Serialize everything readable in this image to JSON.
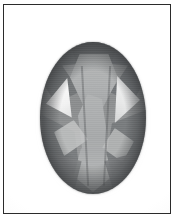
{
  "image": {
    "kind": "photograph",
    "subject": "oval-cut faceted gemstone",
    "rendering": "grayscale",
    "caption": "",
    "frame": {
      "present": true,
      "style": "thin rectangular border",
      "color": "#2b2b2b",
      "background_color": "#fdfdfd"
    },
    "background": {
      "color": "#ffffff",
      "description": "plain white studio backdrop with soft shadow"
    },
    "gemstone": {
      "cut": "oval brilliant",
      "outline": "oval",
      "body_color": "#8f9192",
      "highlight_color": "#ffffff",
      "shadow_color": "#74777a",
      "facets": [
        {
          "name": "table",
          "tone": "light",
          "color": "#b0b2b3"
        },
        {
          "name": "crown-upper-left-break",
          "tone": "dark",
          "color": "#75787a"
        },
        {
          "name": "crown-upper-right-break",
          "tone": "dark",
          "color": "#74777a"
        },
        {
          "name": "top-cap",
          "tone": "dark",
          "color": "#6f7274"
        },
        {
          "name": "star-left",
          "tone": "mid",
          "color": "#9c9e9f"
        },
        {
          "name": "star-right",
          "tone": "mid",
          "color": "#9a9c9d"
        },
        {
          "name": "left-triangular-highlight",
          "tone": "bright",
          "color": "#ffffff"
        },
        {
          "name": "right-triangular-highlight",
          "tone": "bright",
          "color": "#f0f1f1"
        },
        {
          "name": "pavilion-center-wedge",
          "tone": "light",
          "color": "#adafb0"
        },
        {
          "name": "pavilion-left-wedge",
          "tone": "dark",
          "color": "#7b7e80"
        },
        {
          "name": "pavilion-right-wedge",
          "tone": "dark",
          "color": "#7a7d7f"
        },
        {
          "name": "lower-left-flash",
          "tone": "light",
          "color": "#c3c5c5"
        },
        {
          "name": "lower-right-flash",
          "tone": "light",
          "color": "#bdbfbf"
        },
        {
          "name": "culet-panel",
          "tone": "light",
          "color": "#b5b7b7"
        },
        {
          "name": "bottom-left-break",
          "tone": "dark",
          "color": "#828486"
        },
        {
          "name": "bottom-right-break",
          "tone": "dark",
          "color": "#818386"
        }
      ]
    }
  }
}
